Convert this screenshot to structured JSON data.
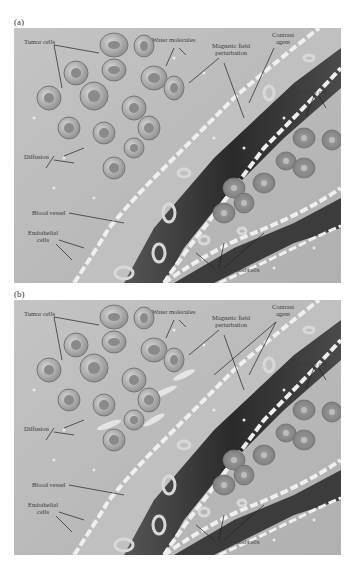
{
  "figure": {
    "panels": [
      {
        "id": "a",
        "label": "(a)",
        "annotations": {
          "tumor_cells": "Tumor cells",
          "water_molecules": "Water molecules",
          "magnetic_field_l1": "Magnetic field",
          "magnetic_field_l2": "perturbation",
          "contrast_l1": "Contrast",
          "contrast_l2": "agent",
          "normal_cells": "Normal cells",
          "diffusion": "Diffusion",
          "blood_vessel": "Blood vessel",
          "endothelial_l1": "Endothelial",
          "endothelial_l2": "cells",
          "red_blood_cells": "Red blood cells"
        }
      },
      {
        "id": "b",
        "label": "(b)",
        "annotations": {
          "tumor_cells": "Tumor cells",
          "water_molecules": "Water molecules",
          "magnetic_field_l1": "Magnetic field",
          "magnetic_field_l2": "perturbation",
          "contrast_l1": "Contrast",
          "contrast_l2": "agent",
          "normal_cells": "Normal cells",
          "diffusion": "Diffusion",
          "blood_vessel": "Blood vessel",
          "endothelial_l1": "Endothelial",
          "endothelial_l2": "cells",
          "red_blood_cells": "Red blood cells"
        }
      }
    ],
    "colors": {
      "tissue": "#b9b9b9",
      "vessel_lumen": "#3a3a3a",
      "tumor_cell": "#9a9a9a",
      "normal_cell": "#8c8c8c",
      "endothelium": "#e6e6e6",
      "text": "#3a3a3a"
    }
  }
}
